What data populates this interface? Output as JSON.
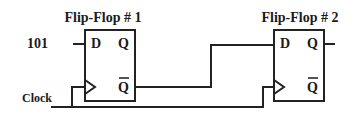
{
  "diagram": {
    "type": "sequential-logic-circuit",
    "colors": {
      "line": "#222222",
      "text": "#1a1a1a",
      "background": "#ffffff"
    },
    "input_label": "101",
    "clock_label": "Clock",
    "flip_flops": [
      {
        "title": "Flip-Flop # 1",
        "pins": {
          "d": "D",
          "q": "Q",
          "qbar": "Q",
          "clock": "clock-triangle"
        }
      },
      {
        "title": "Flip-Flop # 2",
        "pins": {
          "d": "D",
          "q": "Q",
          "qbar": "Q",
          "clock": "clock-triangle"
        }
      }
    ],
    "connections": [
      {
        "from": "101",
        "to": "Flip-Flop # 1.D"
      },
      {
        "from": "Flip-Flop # 1.Q-bar",
        "to": "Flip-Flop # 2.D"
      },
      {
        "from": "Clock",
        "to": "Flip-Flop # 1.clock"
      },
      {
        "from": "Clock",
        "to": "Flip-Flop # 2.clock"
      },
      {
        "from": "Flip-Flop # 2.Q",
        "to": "output"
      }
    ]
  }
}
